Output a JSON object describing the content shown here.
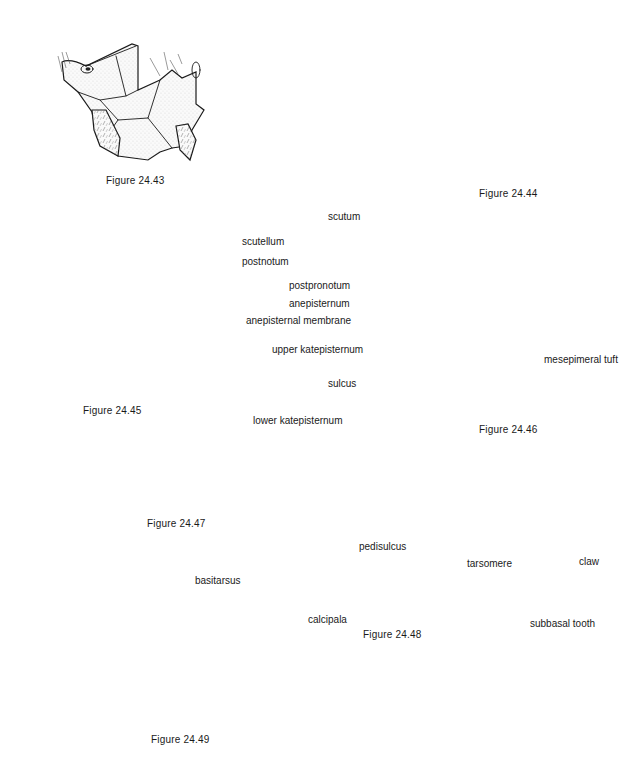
{
  "figures": [
    {
      "id": "24.43",
      "caption": "Figure 24.43",
      "subject": "thorax, lateral view"
    },
    {
      "id": "24.44",
      "caption": "Figure 24.44",
      "subject": "thorax, lateral view"
    },
    {
      "id": "24.45",
      "caption": "Figure 24.45",
      "subject": "thorax, lateral view",
      "labels": [
        "scutellum",
        "postnotum"
      ]
    },
    {
      "id": "24.46",
      "caption": "Figure 24.46",
      "subject": "thorax, lateral view",
      "labels": [
        "scutum",
        "postpronotum",
        "anepisternum",
        "anepisternal membrane",
        "upper katepisternum",
        "sulcus",
        "lower katepisternum",
        "mesepimeral tuft"
      ]
    },
    {
      "id": "24.47",
      "caption": "Figure 24.47",
      "subject": "hind tarsus"
    },
    {
      "id": "24.48",
      "caption": "Figure 24.48",
      "subject": "hind tarsus",
      "labels": [
        "basitarsus",
        "pedisulcus",
        "tarsomere",
        "claw",
        "calcipala",
        "subbasal tooth"
      ]
    },
    {
      "id": "24.49",
      "caption": "Figure 24.49",
      "subject": "hind tarsus"
    }
  ],
  "labels": {
    "f45": {
      "scutellum": "scutellum",
      "postnotum": "postnotum"
    },
    "f46": {
      "scutum": "scutum",
      "postpronotum": "postpronotum",
      "anepisternum": "anepisternum",
      "anepisternal_membrane": "anepisternal membrane",
      "upper_katepisternum": "upper katepisternum",
      "sulcus": "sulcus",
      "lower_katepisternum": "lower katepisternum",
      "mesepimeral_tuft": "mesepimeral tuft"
    },
    "f48": {
      "basitarsus": "basitarsus",
      "pedisulcus": "pedisulcus",
      "tarsomere": "tarsomere",
      "claw": "claw",
      "calcipala": "calcipala",
      "subbasal_tooth": "subbasal tooth"
    }
  },
  "captions": {
    "f43": "Figure 24.43",
    "f44": "Figure 24.44",
    "f45": "Figure 24.45",
    "f46": "Figure 24.46",
    "f47": "Figure 24.47",
    "f48": "Figure 24.48",
    "f49": "Figure 24.49"
  }
}
